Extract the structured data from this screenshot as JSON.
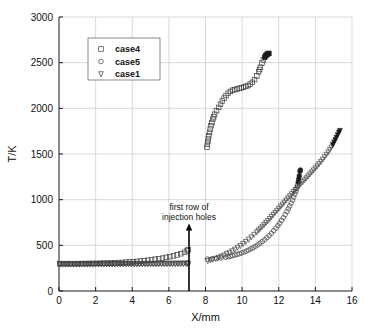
{
  "chart_data": {
    "type": "scatter",
    "title": "",
    "xlabel": "X/mm",
    "ylabel": "T/K",
    "xlim": [
      0,
      16
    ],
    "ylim": [
      0,
      3000
    ],
    "xticks": [
      0,
      2,
      4,
      6,
      8,
      10,
      12,
      14,
      16
    ],
    "yticks": [
      0,
      500,
      1000,
      1500,
      2000,
      2500,
      3000
    ],
    "grid": true,
    "legend_position": "upper-left",
    "legend": [
      "case4",
      "case5",
      "case1"
    ],
    "markers": {
      "case4": "square",
      "case5": "circle",
      "case1": "triangle-down"
    },
    "annotations": [
      {
        "text_line1": "first row of",
        "text_line2": "injection holes",
        "arrow_x": 7.1,
        "arrow_y_from": 0,
        "arrow_y_to": 740
      }
    ],
    "series": [
      {
        "name": "case4",
        "marker": "square",
        "segments": [
          {
            "note": "upstream wall branch",
            "points": [
              [
                0.05,
                300
              ],
              [
                0.25,
                300
              ],
              [
                0.45,
                300
              ],
              [
                0.65,
                300
              ],
              [
                0.85,
                300
              ],
              [
                1.05,
                300
              ],
              [
                1.25,
                301
              ],
              [
                1.45,
                301
              ],
              [
                1.65,
                302
              ],
              [
                1.85,
                302
              ],
              [
                2.05,
                303
              ],
              [
                2.25,
                304
              ],
              [
                2.45,
                305
              ],
              [
                2.65,
                306
              ],
              [
                2.85,
                307
              ],
              [
                3.05,
                309
              ],
              [
                3.25,
                311
              ],
              [
                3.45,
                313
              ],
              [
                3.65,
                315
              ],
              [
                3.85,
                318
              ],
              [
                4.05,
                321
              ],
              [
                4.25,
                324
              ],
              [
                4.45,
                328
              ],
              [
                4.65,
                332
              ],
              [
                4.85,
                337
              ],
              [
                5.05,
                342
              ],
              [
                5.25,
                348
              ],
              [
                5.45,
                354
              ],
              [
                5.65,
                360
              ],
              [
                5.85,
                368
              ],
              [
                6.05,
                376
              ],
              [
                6.25,
                385
              ],
              [
                6.45,
                395
              ],
              [
                6.65,
                408
              ],
              [
                6.85,
                424
              ],
              [
                7.0,
                440
              ],
              [
                7.05,
                452
              ]
            ]
          },
          {
            "note": "downstream hot branch",
            "points": [
              [
                8.08,
                1575
              ],
              [
                8.18,
                1700
              ],
              [
                8.3,
                1810
              ],
              [
                8.4,
                1880
              ],
              [
                8.5,
                1935
              ],
              [
                8.6,
                1975
              ],
              [
                8.72,
                2010
              ],
              [
                8.82,
                2045
              ],
              [
                8.92,
                2080
              ],
              [
                9.02,
                2112
              ],
              [
                9.12,
                2140
              ],
              [
                9.24,
                2165
              ],
              [
                9.36,
                2185
              ],
              [
                9.48,
                2198
              ],
              [
                9.6,
                2205
              ],
              [
                9.72,
                2212
              ],
              [
                9.84,
                2218
              ],
              [
                9.96,
                2225
              ],
              [
                10.08,
                2232
              ],
              [
                10.2,
                2240
              ],
              [
                10.32,
                2250
              ],
              [
                10.44,
                2265
              ],
              [
                10.56,
                2285
              ],
              [
                10.68,
                2315
              ],
              [
                10.8,
                2355
              ],
              [
                10.9,
                2400
              ],
              [
                11.0,
                2450
              ],
              [
                11.08,
                2495
              ],
              [
                11.16,
                2530
              ],
              [
                11.24,
                2560
              ],
              [
                11.3,
                2578
              ],
              [
                11.36,
                2590
              ],
              [
                11.42,
                2598
              ],
              [
                11.46,
                2602
              ]
            ]
          }
        ]
      },
      {
        "name": "case5",
        "marker": "circle",
        "segments": [
          {
            "note": "upstream wall branch",
            "points": [
              [
                0.05,
                298
              ],
              [
                0.35,
                298
              ],
              [
                0.65,
                298
              ],
              [
                0.95,
                298
              ],
              [
                1.25,
                298
              ],
              [
                1.55,
                298
              ],
              [
                1.85,
                299
              ],
              [
                2.15,
                299
              ],
              [
                2.45,
                299
              ],
              [
                2.75,
                300
              ],
              [
                3.05,
                300
              ],
              [
                3.35,
                300
              ],
              [
                3.65,
                301
              ],
              [
                3.95,
                301
              ],
              [
                4.25,
                302
              ],
              [
                4.55,
                302
              ],
              [
                4.85,
                303
              ],
              [
                5.15,
                303
              ],
              [
                5.45,
                304
              ],
              [
                5.75,
                305
              ],
              [
                6.05,
                305
              ],
              [
                6.35,
                306
              ],
              [
                6.65,
                307
              ],
              [
                6.95,
                308
              ],
              [
                7.05,
                309
              ]
            ]
          },
          {
            "note": "downstream branch",
            "points": [
              [
                8.1,
                350
              ],
              [
                8.35,
                352
              ],
              [
                8.6,
                356
              ],
              [
                8.85,
                362
              ],
              [
                9.1,
                370
              ],
              [
                9.35,
                380
              ],
              [
                9.6,
                393
              ],
              [
                9.85,
                408
              ],
              [
                10.1,
                426
              ],
              [
                10.35,
                448
              ],
              [
                10.6,
                474
              ],
              [
                10.85,
                505
              ],
              [
                11.1,
                541
              ],
              [
                11.35,
                583
              ],
              [
                11.6,
                632
              ],
              [
                11.85,
                688
              ],
              [
                12.05,
                742
              ],
              [
                12.25,
                802
              ],
              [
                12.45,
                870
              ],
              [
                12.6,
                930
              ],
              [
                12.75,
                995
              ],
              [
                12.88,
                1060
              ],
              [
                12.98,
                1120
              ],
              [
                13.06,
                1190
              ],
              [
                13.12,
                1260
              ],
              [
                13.16,
                1310
              ],
              [
                13.18,
                1325
              ]
            ]
          }
        ]
      },
      {
        "name": "case1",
        "marker": "triangle-down",
        "segments": [
          {
            "note": "upstream wall branch",
            "points": [
              [
                0.05,
                292
              ],
              [
                0.35,
                292
              ],
              [
                0.65,
                292
              ],
              [
                0.95,
                292
              ],
              [
                1.25,
                292
              ],
              [
                1.55,
                292
              ],
              [
                1.85,
                292
              ],
              [
                2.15,
                293
              ],
              [
                2.45,
                293
              ],
              [
                2.75,
                293
              ],
              [
                3.05,
                293
              ],
              [
                3.35,
                293
              ],
              [
                3.65,
                294
              ],
              [
                3.95,
                294
              ],
              [
                4.25,
                294
              ],
              [
                4.55,
                294
              ],
              [
                4.85,
                295
              ],
              [
                5.15,
                295
              ],
              [
                5.45,
                295
              ],
              [
                5.75,
                296
              ],
              [
                6.05,
                296
              ],
              [
                6.35,
                296
              ],
              [
                6.65,
                297
              ],
              [
                6.95,
                297
              ],
              [
                7.05,
                298
              ]
            ]
          },
          {
            "note": "downstream branch",
            "points": [
              [
                8.12,
                330
              ],
              [
                8.4,
                345
              ],
              [
                8.7,
                365
              ],
              [
                9.0,
                390
              ],
              [
                9.3,
                420
              ],
              [
                9.6,
                455
              ],
              [
                9.9,
                495
              ],
              [
                10.2,
                540
              ],
              [
                10.5,
                590
              ],
              [
                10.8,
                645
              ],
              [
                11.1,
                705
              ],
              [
                11.4,
                768
              ],
              [
                11.7,
                835
              ],
              [
                12.0,
                903
              ],
              [
                12.3,
                970
              ],
              [
                12.6,
                1040
              ],
              [
                12.9,
                1108
              ],
              [
                13.2,
                1172
              ],
              [
                13.5,
                1235
              ],
              [
                13.8,
                1300
              ],
              [
                14.1,
                1368
              ],
              [
                14.4,
                1440
              ],
              [
                14.7,
                1520
              ],
              [
                14.95,
                1600
              ],
              [
                15.15,
                1680
              ],
              [
                15.28,
                1735
              ],
              [
                15.34,
                1755
              ]
            ]
          }
        ]
      }
    ]
  },
  "legend_items": [
    {
      "label": "case4",
      "marker": "square"
    },
    {
      "label": "case5",
      "marker": "circle"
    },
    {
      "label": "case1",
      "marker": "triangle-down"
    }
  ],
  "colors": {
    "axis": "#1a1a1a",
    "grid": "#c8c8c8",
    "marker": "#3d3d3d",
    "marker_dense": "#1c1c1c",
    "background": "#ffffff"
  }
}
